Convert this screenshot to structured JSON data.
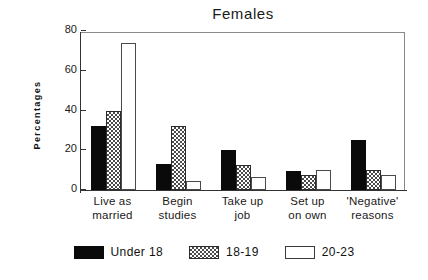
{
  "chart_data": {
    "type": "bar",
    "title": "Females",
    "xlabel": "",
    "ylabel": "Percentages",
    "ylim": [
      0,
      80
    ],
    "yticks": [
      0,
      20,
      40,
      60,
      80
    ],
    "ytick_labels": [
      "0",
      "20",
      "40",
      "60",
      "80"
    ],
    "grid": false,
    "legend_position": "bottom",
    "categories": [
      "Live as married",
      "Begin studies",
      "Take up job",
      "Set up on own",
      "'Negative' reasons"
    ],
    "category_lines": [
      [
        "Live as",
        "married"
      ],
      [
        "Begin",
        "studies"
      ],
      [
        "Take up",
        "job"
      ],
      [
        "Set up",
        "on own"
      ],
      [
        "'Negative'",
        "reasons"
      ]
    ],
    "series": [
      {
        "name": "Under 18",
        "fill": "solid-black",
        "color": "#0a0a0a",
        "values": [
          32,
          13,
          20,
          9.5,
          25
        ]
      },
      {
        "name": "18-19",
        "fill": "checkered-hatch",
        "color": "#4a4a4a",
        "values": [
          40,
          32,
          12.5,
          7.5,
          10
        ]
      },
      {
        "name": "20-23",
        "fill": "white-outline",
        "color": "#ffffff",
        "values": [
          74,
          4.5,
          6.5,
          10,
          7.5
        ]
      }
    ]
  },
  "figure": {
    "background": "#ffffff",
    "frame_color": "#8a8a8a",
    "axis_color": "#333333",
    "text_color": "#1a1a1a"
  }
}
